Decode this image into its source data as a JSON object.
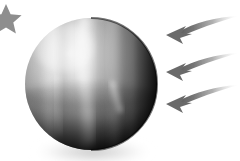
{
  "scene": {
    "title": "Planet with incoming arrows",
    "width": 240,
    "height": 161,
    "background_color": "#ffffff",
    "alt_text": "Grayscale illustration of a banded gas-giant planet lit from the upper left, with three curved arrows approaching from the right and a small star at the upper left corner."
  },
  "planet": {
    "label": "planet",
    "center_x": 91,
    "center_y": 84,
    "radius": 66,
    "highlight_x": 63,
    "highlight_y": 48,
    "light_direction": "upper-left",
    "colors": {
      "highlight": "#f2f2f2",
      "midtone": "#9a9a9a",
      "shadow": "#2a2a2a",
      "terminator": "#050505",
      "rim": "#000000"
    },
    "bands": [
      {
        "name": "band-left-light",
        "x": 50,
        "width": 9,
        "tone": "#c9c9c9",
        "opacity": 0.4
      },
      {
        "name": "band-left-dark",
        "x": 62,
        "width": 7,
        "tone": "#6f6f6f",
        "opacity": 0.22
      },
      {
        "name": "band-center-light",
        "x": 82,
        "width": 11,
        "tone": "#dcdcdc",
        "opacity": 0.45
      },
      {
        "name": "band-center-dark",
        "x": 97,
        "width": 8,
        "tone": "#5c5c5c",
        "opacity": 0.25
      },
      {
        "name": "band-right-light",
        "x": 112,
        "width": 9,
        "tone": "#d5d5d5",
        "opacity": 0.38
      },
      {
        "name": "band-equator-dark",
        "x": 0,
        "width": 0,
        "tone": "#4a4a4a",
        "opacity": 0.18
      }
    ],
    "streaks": [
      {
        "name": "streak-upper-center",
        "tone": "#e8e8e8",
        "opacity": 0.55
      },
      {
        "name": "streak-lower-right",
        "tone": "#f0f0f0",
        "opacity": 0.7
      },
      {
        "name": "streak-lower-left",
        "tone": "#c0c0c0",
        "opacity": 0.35
      }
    ],
    "shadow": {
      "name": "ground-shadow",
      "color": "#b8b8b8",
      "opacity": 0.55,
      "offset_y": 14
    }
  },
  "arrows": {
    "label": "incoming arrows",
    "count": 3,
    "color": "#6e6e6e",
    "tail_color": "#ffffff",
    "direction": "pointing-left",
    "items": [
      {
        "name": "arrow-top",
        "tip_x": 166,
        "tip_y": 34,
        "tail_x": 238,
        "tail_y": 19,
        "head_size": 13
      },
      {
        "name": "arrow-middle",
        "tip_x": 166,
        "tip_y": 72,
        "tail_x": 238,
        "tail_y": 56,
        "head_size": 13
      },
      {
        "name": "arrow-bottom",
        "tip_x": 166,
        "tip_y": 104,
        "tail_x": 238,
        "tail_y": 88,
        "head_size": 13
      }
    ]
  },
  "star": {
    "name": "star",
    "label": "star",
    "center_x": 6,
    "center_y": 19,
    "outer_radius": 15,
    "inner_radius": 6,
    "color": "#8e8e8e",
    "points": 5,
    "clipped_edge": "left"
  }
}
